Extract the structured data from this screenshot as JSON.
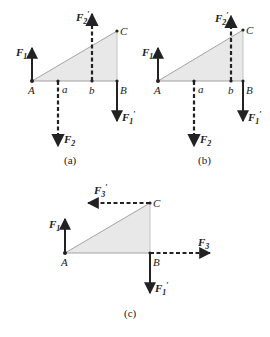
{
  "colors": {
    "fill": "#e8e8e8",
    "line": "#222222",
    "edge": "#9a9a9a"
  },
  "panels": [
    {
      "caption": "(a)",
      "points": {
        "A": "A",
        "a": "a",
        "b": "b",
        "B": "B",
        "C": "C"
      },
      "forces": {
        "F1": {
          "main": "F",
          "sub": "1",
          "prime": ""
        },
        "F2prime": {
          "main": "F",
          "sub": "2",
          "prime": "′"
        },
        "F2": {
          "main": "F",
          "sub": "2",
          "prime": ""
        },
        "F1prime": {
          "main": "F",
          "sub": "1",
          "prime": "′"
        }
      }
    },
    {
      "caption": "(b)",
      "points": {
        "A": "A",
        "a": "a",
        "b": "b",
        "B": "B",
        "C": "C"
      },
      "forces": {
        "F1": {
          "main": "F",
          "sub": "1",
          "prime": ""
        },
        "F2prime": {
          "main": "F",
          "sub": "2",
          "prime": "′"
        },
        "F2": {
          "main": "F",
          "sub": "2",
          "prime": ""
        },
        "F1prime": {
          "main": "F",
          "sub": "1",
          "prime": "′"
        }
      }
    },
    {
      "caption": "(c)",
      "points": {
        "A": "A",
        "B": "B",
        "C": "C"
      },
      "forces": {
        "F1": {
          "main": "F",
          "sub": "1",
          "prime": ""
        },
        "F3prime": {
          "main": "F",
          "sub": "3",
          "prime": "′"
        },
        "F3": {
          "main": "F",
          "sub": "3",
          "prime": ""
        },
        "F1prime": {
          "main": "F",
          "sub": "1",
          "prime": "′"
        }
      }
    }
  ]
}
